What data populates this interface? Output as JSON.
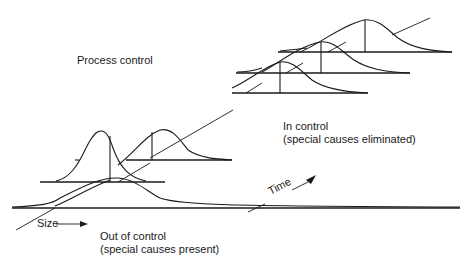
{
  "diagram": {
    "title": "Process control",
    "labels": {
      "in_control_line1": "In control",
      "in_control_line2": "(special causes eliminated)",
      "out_of_control_line1": "Out of control",
      "out_of_control_line2": "(special causes present)",
      "size_axis": "Size",
      "time_axis": "Time"
    },
    "distributions": [
      {
        "id": "out-of-control-wide",
        "state": "out of control"
      },
      {
        "id": "out-of-control-narrow",
        "state": "out of control"
      },
      {
        "id": "out-of-control-shifted",
        "state": "out of control"
      },
      {
        "id": "in-control-1",
        "state": "in control"
      },
      {
        "id": "in-control-2",
        "state": "in control"
      },
      {
        "id": "in-control-3",
        "state": "in control"
      }
    ],
    "colors": {
      "ink": "#1a1a1a",
      "background": "#ffffff"
    }
  }
}
